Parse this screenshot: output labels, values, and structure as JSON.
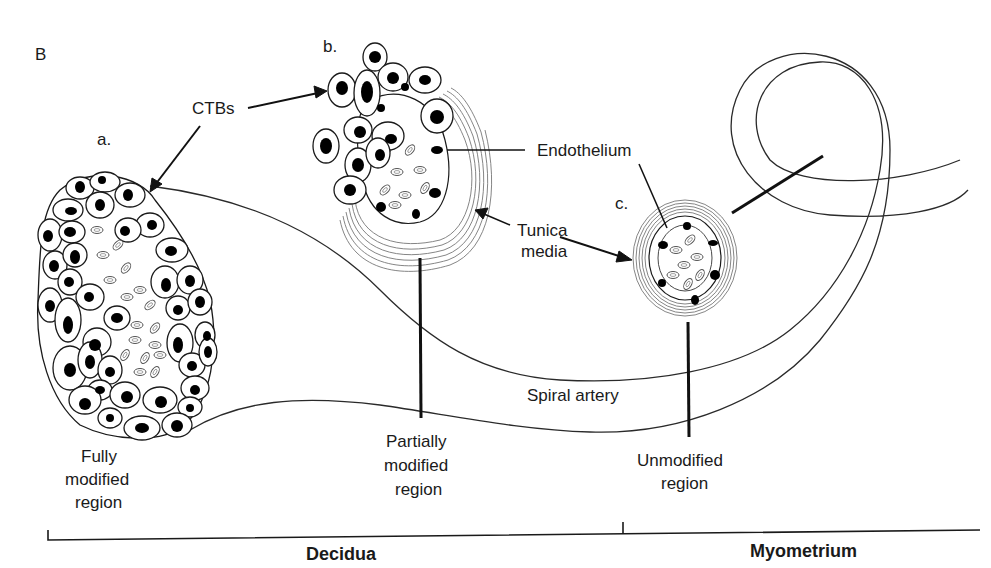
{
  "panel_label": "B",
  "sections": {
    "a": {
      "letter": "a.",
      "region_line1": "Fully",
      "region_line2": "modified",
      "region_line3": "region"
    },
    "b": {
      "letter": "b.",
      "region_line1": "Partially",
      "region_line2": "modified",
      "region_line3": "region"
    },
    "c": {
      "letter": "c.",
      "region_line1": "Unmodified",
      "region_line2": "region"
    }
  },
  "annotations": {
    "ctbs": "CTBs",
    "endothelium": "Endothelium",
    "tunica_line1": "Tunica",
    "tunica_line2": "media",
    "spiral_artery": "Spiral artery"
  },
  "axis": {
    "decidua": "Decidua",
    "myometrium": "Myometrium"
  },
  "colors": {
    "line": "#1a1a1a",
    "nucleus": "#000000",
    "background": "#ffffff"
  }
}
